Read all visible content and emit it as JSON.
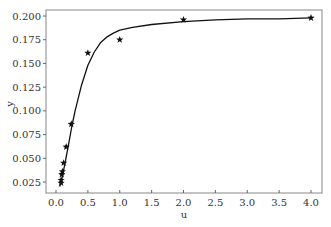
{
  "chart_data": {
    "type": "scatter",
    "title": "",
    "xlabel": "u",
    "ylabel": "y",
    "xlim": [
      -0.1,
      4.2
    ],
    "ylim": [
      0.016,
      0.204
    ],
    "xticks": [
      0.0,
      0.5,
      1.0,
      1.5,
      2.0,
      2.5,
      3.0,
      3.5,
      4.0
    ],
    "xtick_labels": [
      "0.0",
      "0.5",
      "1.0",
      "1.5",
      "2.0",
      "2.5",
      "3.0",
      "3.5",
      "4.0"
    ],
    "yticks": [
      0.025,
      0.05,
      0.075,
      0.1,
      0.125,
      0.15,
      0.175,
      0.2
    ],
    "ytick_labels": [
      "0.025",
      "0.050",
      "0.075",
      "0.100",
      "0.125",
      "0.150",
      "0.175",
      "0.200"
    ],
    "grid": false,
    "legend": null,
    "series": [
      {
        "name": "observations",
        "marker": "star",
        "color": "#000000",
        "x": [
          0.08,
          0.08,
          0.09,
          0.1,
          0.12,
          0.16,
          0.24,
          0.5,
          1.0,
          2.0,
          4.0
        ],
        "y": [
          0.024,
          0.027,
          0.033,
          0.036,
          0.045,
          0.062,
          0.086,
          0.161,
          0.175,
          0.196,
          0.198
        ]
      },
      {
        "name": "fitted curve",
        "style": "line",
        "color": "#000000",
        "x": [
          0.06,
          0.1,
          0.15,
          0.2,
          0.25,
          0.3,
          0.4,
          0.5,
          0.6,
          0.7,
          0.8,
          0.9,
          1.0,
          1.2,
          1.5,
          2.0,
          2.5,
          3.0,
          3.5,
          4.0
        ],
        "y": [
          0.02,
          0.031,
          0.048,
          0.066,
          0.084,
          0.1,
          0.127,
          0.148,
          0.162,
          0.172,
          0.178,
          0.182,
          0.185,
          0.188,
          0.191,
          0.194,
          0.196,
          0.197,
          0.197,
          0.198
        ]
      }
    ]
  }
}
